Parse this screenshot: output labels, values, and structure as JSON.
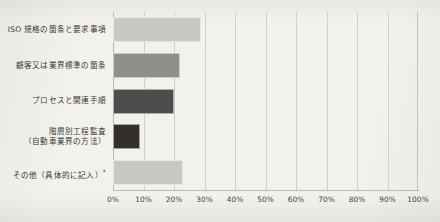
{
  "chart_data": {
    "type": "bar",
    "orientation": "horizontal",
    "title": "",
    "xlabel": "",
    "ylabel": "",
    "xlim": [
      0,
      100
    ],
    "grid": true,
    "legend": false,
    "x_tick_labels": [
      "0%",
      "10%",
      "20%",
      "30%",
      "40%",
      "50%",
      "60%",
      "70%",
      "80%",
      "90%",
      "100%"
    ],
    "x_tick_values": [
      0,
      10,
      20,
      30,
      40,
      50,
      60,
      70,
      80,
      90,
      100
    ],
    "categories": [
      "ISO 規格の箇条と要求事項",
      "顧客又は業界標準の箇条",
      "プロセスと関連手順",
      "階層別工程監査",
      "その他（具体的に記入）"
    ],
    "values": [
      29,
      22,
      20,
      9,
      23
    ],
    "bars": [
      {
        "label": "ISO 規格の箇条と要求事項",
        "label_line2": "",
        "value": 29,
        "color": "#c9c8c2",
        "note": ""
      },
      {
        "label": "顧客又は業界標準の箇条",
        "label_line2": "",
        "value": 22,
        "color": "#8f8f8b",
        "note": ""
      },
      {
        "label": "プロセスと関連手順",
        "label_line2": "",
        "value": 20,
        "color": "#4d4d4b",
        "note": ""
      },
      {
        "label": "階層別工程監査",
        "label_line2": "（自動車業界の方法）",
        "value": 9,
        "color": "#332f2c",
        "note": ""
      },
      {
        "label": "その他（具体的に記入）",
        "label_line2": "",
        "value": 23,
        "color": "#c9c8c2",
        "note": "*"
      }
    ],
    "colors": {
      "background": "#f2f1ec",
      "gridline": "#d2d1c9",
      "axis": "#b9b8b2",
      "text": "#3b3833"
    }
  }
}
